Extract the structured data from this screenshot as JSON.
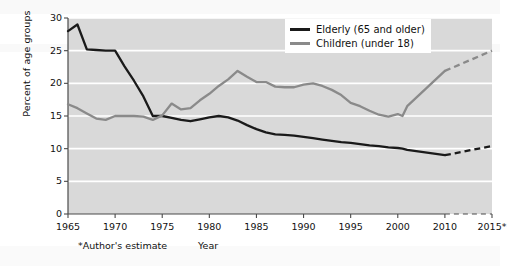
{
  "chart_data": {
    "type": "line",
    "title": "",
    "xlabel": "Year",
    "ylabel": "Percent of age groups",
    "footnote": "*Author's estimate",
    "xlim": [
      1965,
      2015
    ],
    "ylim": [
      0,
      30
    ],
    "ytick_values": [
      0,
      5,
      10,
      15,
      20,
      25,
      30
    ],
    "ytick_labels": [
      "0",
      "5",
      "10",
      "15",
      "20",
      "25",
      "30"
    ],
    "xtick_values": [
      1965,
      1970,
      1975,
      1980,
      1985,
      1990,
      1995,
      2000,
      2010,
      2015
    ],
    "xtick_labels": [
      "1965",
      "1970",
      "1975",
      "1980",
      "1985",
      "1990",
      "1995",
      "2000",
      "2010",
      "2015*"
    ],
    "grid": "horizontal",
    "legend_position": "top-right",
    "plot_background": "#d9d9d9",
    "gridline_color": "#ffffff",
    "series": [
      {
        "name": "Elderly (65 and older)",
        "color": "#1a1a1a",
        "x": [
          1965,
          1966,
          1967,
          1968,
          1969,
          1970,
          1971,
          1972,
          1973,
          1974,
          1975,
          1976,
          1977,
          1978,
          1979,
          1980,
          1981,
          1982,
          1983,
          1984,
          1985,
          1986,
          1987,
          1988,
          1989,
          1990,
          1991,
          1992,
          1993,
          1994,
          1995,
          1996,
          1997,
          1998,
          1999,
          2000,
          2001,
          2002,
          2010
        ],
        "values": [
          28.0,
          29.0,
          25.2,
          25.1,
          25.0,
          25.0,
          22.6,
          20.4,
          18.0,
          15.0,
          15.0,
          14.7,
          14.4,
          14.2,
          14.5,
          14.8,
          15.0,
          14.8,
          14.3,
          13.6,
          13.0,
          12.5,
          12.2,
          12.1,
          12.0,
          11.8,
          11.6,
          11.4,
          11.2,
          11.0,
          10.9,
          10.7,
          10.5,
          10.4,
          10.2,
          10.1,
          10.0,
          9.8,
          9.0
        ],
        "projection": {
          "style": "dashed",
          "x": [
            2010,
            2015
          ],
          "values": [
            9.0,
            10.4
          ]
        }
      },
      {
        "name": "Children (under 18)",
        "color": "#8a8a8a",
        "x": [
          1965,
          1966,
          1967,
          1968,
          1969,
          1970,
          1971,
          1972,
          1973,
          1974,
          1975,
          1976,
          1977,
          1978,
          1979,
          1980,
          1981,
          1982,
          1983,
          1984,
          1985,
          1986,
          1987,
          1988,
          1989,
          1990,
          1991,
          1992,
          1993,
          1994,
          1995,
          1996,
          1997,
          1998,
          1999,
          2000,
          2001,
          2002,
          2010
        ],
        "values": [
          16.8,
          16.2,
          15.4,
          14.6,
          14.4,
          15.0,
          15.0,
          15.0,
          14.9,
          14.4,
          15.1,
          16.9,
          16.0,
          16.2,
          17.4,
          18.4,
          19.6,
          20.6,
          21.9,
          21.0,
          20.2,
          20.2,
          19.5,
          19.4,
          19.4,
          19.8,
          20.0,
          19.6,
          19.0,
          18.2,
          17.0,
          16.5,
          15.8,
          15.2,
          14.9,
          15.3,
          15.0,
          16.5,
          21.9
        ],
        "projection": {
          "style": "dashed",
          "x": [
            2010,
            2015
          ],
          "values": [
            21.9,
            25.0
          ]
        }
      }
    ]
  },
  "legend": {
    "items": [
      {
        "label": "Elderly (65 and older)"
      },
      {
        "label": "Children (under 18)"
      }
    ]
  }
}
